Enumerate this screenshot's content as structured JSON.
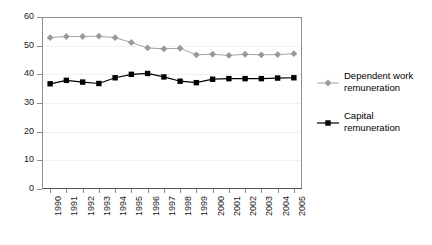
{
  "chart_data": {
    "type": "line",
    "title": "",
    "subtitle": "",
    "xlabel": "",
    "ylabel": "",
    "categories": [
      "1990",
      "1991",
      "1992",
      "1993",
      "1994",
      "1995",
      "1996",
      "1997",
      "1998",
      "1999",
      "2000",
      "2001",
      "2002",
      "2003",
      "2004",
      "2005"
    ],
    "x_tick_labels": [
      "1990",
      "1991",
      "1992",
      "1993",
      "1994",
      "1995",
      "1996",
      "1997",
      "1998",
      "1999",
      "2000",
      "2001",
      "2002",
      "2003",
      "2004",
      "2005"
    ],
    "y_tick_labels": [
      "0",
      "10",
      "20",
      "30",
      "40",
      "50",
      "60"
    ],
    "y_ticks": [
      0,
      10,
      20,
      30,
      40,
      50,
      60
    ],
    "ylim": [
      0,
      60
    ],
    "grid": true,
    "legend_position": "right",
    "series": [
      {
        "name": "Dependent work remuneration",
        "marker": "diamond",
        "color": "#999999",
        "values": [
          52.8,
          53.2,
          53.2,
          53.3,
          52.8,
          51.1,
          49.2,
          48.9,
          49.1,
          46.8,
          47.0,
          46.6,
          47.0,
          46.8,
          46.9,
          47.2
        ]
      },
      {
        "name": "Capital remuneration",
        "marker": "square",
        "color": "#000000",
        "values": [
          36.7,
          37.9,
          37.3,
          36.8,
          38.8,
          40.0,
          40.3,
          39.1,
          37.6,
          37.1,
          38.3,
          38.5,
          38.5,
          38.5,
          38.7,
          38.8
        ]
      }
    ],
    "legend": [
      {
        "label_line1": "Dependent work",
        "label_line2": "remuneration",
        "marker": "diamond",
        "color": "#999999"
      },
      {
        "label_line1": "Capital",
        "label_line2": "remuneration",
        "marker": "square",
        "color": "#000000"
      }
    ]
  },
  "colors": {
    "series_dependent_work": "#999999",
    "series_capital": "#000000",
    "axis": "#8d8d8d",
    "grid": "#f1f1f1",
    "text": "#1a1a1a",
    "background": "#ffffff"
  }
}
